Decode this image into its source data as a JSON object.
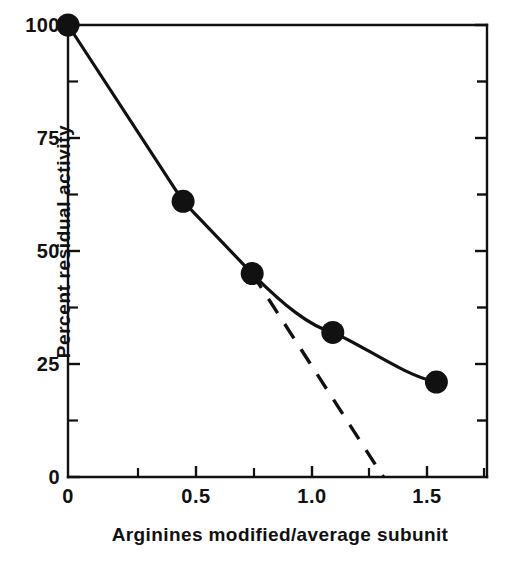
{
  "figure": {
    "background_color": "#ffffff",
    "ink_color": "#111111"
  },
  "chart_data": {
    "type": "line",
    "title": "",
    "xlabel": "Arginines modified/average subunit",
    "ylabel": "Percent residual activity",
    "xlim": [
      0,
      1.82
    ],
    "ylim": [
      0,
      100
    ],
    "xticks": [
      0,
      0.5,
      1.0,
      1.5
    ],
    "xtick_labels": [
      "0",
      "0.5",
      "1.0",
      "1.5"
    ],
    "xticks_minor": [
      0.25,
      0.75,
      1.25,
      1.75
    ],
    "yticks": [
      0,
      25,
      50,
      75,
      100
    ],
    "ytick_labels": [
      "0",
      "25",
      "50",
      "75",
      "100"
    ],
    "yticks_minor": [
      12.5,
      37.5,
      62.5,
      87.5
    ],
    "grid": false,
    "legend": "none",
    "series": [
      {
        "name": "Residual activity (observed)",
        "style": "solid",
        "marker": "filled-circle",
        "x": [
          0,
          0.5,
          0.8,
          1.15,
          1.6
        ],
        "y": [
          100,
          61,
          45,
          32,
          21
        ]
      },
      {
        "name": "Extrapolated initial slope",
        "style": "dashed",
        "marker": "none",
        "x": [
          0.8,
          1.37
        ],
        "y": [
          45,
          0
        ]
      }
    ],
    "annotations": []
  }
}
